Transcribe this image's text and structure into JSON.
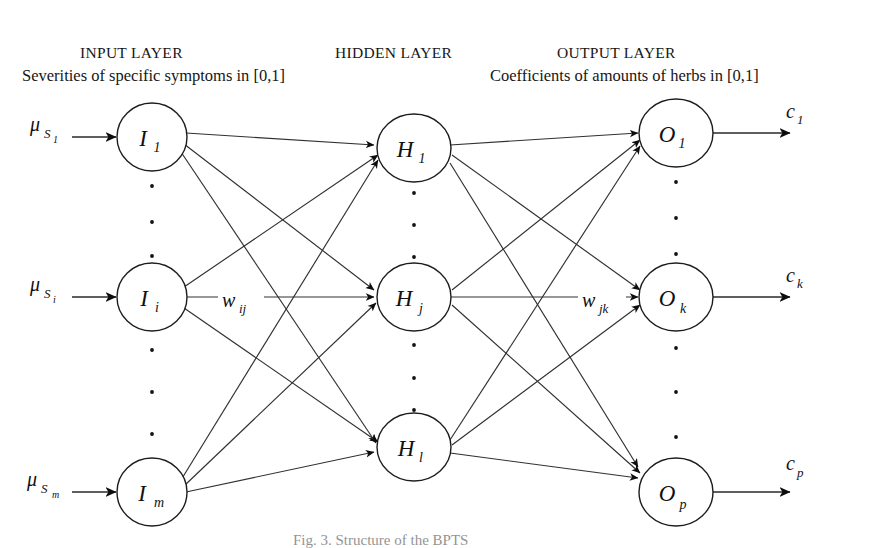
{
  "figure": {
    "caption": "Fig. 3. Structure of the BPTS"
  },
  "layers": {
    "input": {
      "title": "INPUT LAYER",
      "subtitle": "Severities of specific symptoms in [0,1]",
      "nodes": [
        {
          "base": "I",
          "sub": "1"
        },
        {
          "base": "I",
          "sub": "i"
        },
        {
          "base": "I",
          "sub": "m"
        }
      ],
      "inputs": [
        {
          "base": "μ",
          "sub": "S",
          "sub2": "1"
        },
        {
          "base": "μ",
          "sub": "S",
          "sub2": "i"
        },
        {
          "base": "μ",
          "sub": "S",
          "sub2": "m"
        }
      ]
    },
    "hidden": {
      "title": "HIDDEN LAYER",
      "subtitle": "",
      "nodes": [
        {
          "base": "H",
          "sub": "1"
        },
        {
          "base": "H",
          "sub": "j"
        },
        {
          "base": "H",
          "sub": "l"
        }
      ]
    },
    "output": {
      "title": "OUTPUT LAYER",
      "subtitle": "Coefficients of amounts of herbs in [0,1]",
      "nodes": [
        {
          "base": "O",
          "sub": "1"
        },
        {
          "base": "O",
          "sub": "k"
        },
        {
          "base": "O",
          "sub": "p"
        }
      ],
      "outputs": [
        {
          "base": "c",
          "sub": "1"
        },
        {
          "base": "c",
          "sub": "k"
        },
        {
          "base": "c",
          "sub": "p"
        }
      ]
    }
  },
  "weights": {
    "input_to_hidden": {
      "base": "w",
      "sub": "ij"
    },
    "hidden_to_output": {
      "base": "w",
      "sub": "jk"
    }
  },
  "ellipsis": {
    "glyph": "·",
    "count_per_gap": 3
  },
  "colors": {
    "background": "#ffffff",
    "stroke": "#1d1d1d",
    "edge": "#303030",
    "text": "#111111"
  }
}
